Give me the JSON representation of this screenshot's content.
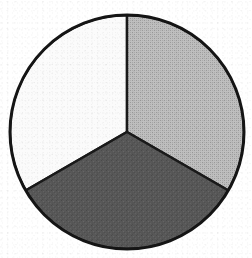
{
  "figure": {
    "title": "Pie chart with three equal segments",
    "background_color": "#ffffff",
    "outline_color": "#151515",
    "outline_width_px": 3,
    "center_x": 127,
    "center_y": 132,
    "radius": 117
  },
  "chart_data": {
    "type": "pie",
    "title": "",
    "subtitle": "",
    "xlabel": "",
    "ylabel": "",
    "grid": false,
    "legend": false,
    "legend_position": "none",
    "start_angle_deg": 0,
    "direction": "clockwise",
    "categories": [
      "Segment 1",
      "Segment 2",
      "Segment 3"
    ],
    "values": [
      33.3,
      33.3,
      33.3
    ],
    "angles_deg": [
      120,
      120,
      120
    ],
    "labels": [
      "",
      "",
      ""
    ],
    "colors": [
      "#b4b4b4",
      "#585858",
      "#fafafa"
    ],
    "slices": [
      {
        "name": "upper-right-slice",
        "value": 33.3,
        "angle_deg": 120,
        "start_angle_deg": 0,
        "end_angle_deg": 120,
        "fill": "#b4b4b4",
        "fill_description": "medium gray halftone",
        "label": ""
      },
      {
        "name": "bottom-slice",
        "value": 33.3,
        "angle_deg": 120,
        "start_angle_deg": 120,
        "end_angle_deg": 240,
        "fill": "#585858",
        "fill_description": "dark gray",
        "label": ""
      },
      {
        "name": "upper-left-slice",
        "value": 33.3,
        "angle_deg": 120,
        "start_angle_deg": 240,
        "end_angle_deg": 360,
        "fill": "#fafafa",
        "fill_description": "white",
        "label": ""
      }
    ]
  }
}
